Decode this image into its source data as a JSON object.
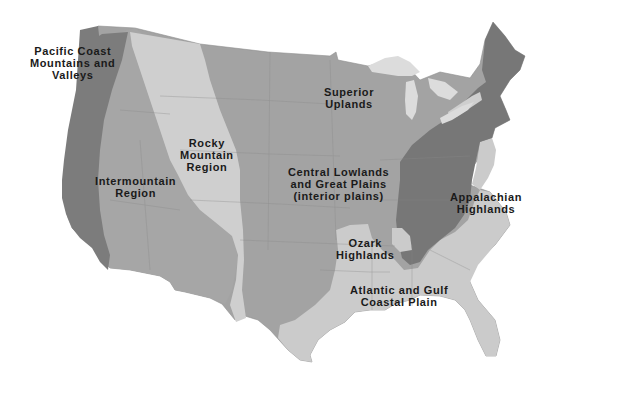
{
  "map": {
    "title": "Landform regions of the United States",
    "colors": {
      "background": "#ffffff",
      "pacific_coast": "#7c7c7c",
      "intermountain": "#a6a6a6",
      "rocky_mountain": "#cfcfcf",
      "interior_plains": "#a3a3a3",
      "superior_uplands": "#a3a3a3",
      "great_lakes": "#dcdcdc",
      "appalachian": "#777777",
      "coastal_plain": "#cbcbcb",
      "ozark": "#a3a3a3",
      "label_text": "#1a1a1a"
    },
    "regions": [
      {
        "id": "pacific",
        "lines": [
          "Pacific Coast",
          "Mountains and",
          "Valleys"
        ]
      },
      {
        "id": "intermountain",
        "lines": [
          "Intermountain",
          "Region"
        ]
      },
      {
        "id": "rocky",
        "lines": [
          "Rocky",
          "Mountain",
          "Region"
        ]
      },
      {
        "id": "superior",
        "lines": [
          "Superior",
          "Uplands"
        ]
      },
      {
        "id": "central",
        "lines": [
          "Central Lowlands",
          "and Great Plains",
          "(interior plains)"
        ]
      },
      {
        "id": "appalachian",
        "lines": [
          "Appalachian",
          "Highlands"
        ]
      },
      {
        "id": "ozark",
        "lines": [
          "Ozark",
          "Highlands"
        ]
      },
      {
        "id": "coastal",
        "lines": [
          "Atlantic and Gulf",
          "Coastal Plain"
        ]
      }
    ]
  }
}
